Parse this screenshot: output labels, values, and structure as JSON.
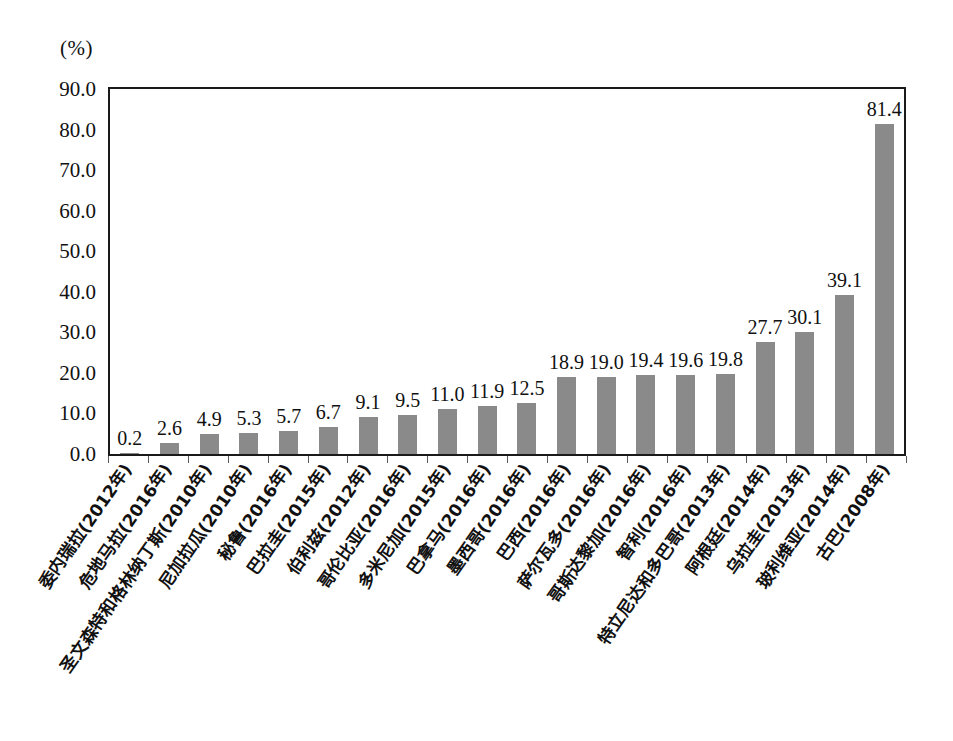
{
  "chart_data": {
    "type": "bar",
    "title": "",
    "subtitle": "",
    "xlabel": "",
    "ylabel": "(%)",
    "unit_label": "(%)",
    "ylim": [
      0.0,
      90.0
    ],
    "ytick_step": 10.0,
    "ytick_labels": [
      "0.0",
      "10.0",
      "20.0",
      "30.0",
      "40.0",
      "50.0",
      "60.0",
      "70.0",
      "80.0",
      "90.0"
    ],
    "ytick_values": [
      0.0,
      10.0,
      20.0,
      30.0,
      40.0,
      50.0,
      60.0,
      70.0,
      80.0,
      90.0
    ],
    "grid": false,
    "legend": false,
    "legend_position": "none",
    "bar_color": "#8a8a8a",
    "frame_color": "#1a1a1a",
    "background_color": "#ffffff",
    "categories": [
      "委内瑞拉(2012年)",
      "危地马拉(2016年)",
      "圣文森特和格林纳丁斯(2010年)",
      "尼加拉瓜(2010年)",
      "秘鲁(2016年)",
      "巴拉圭(2015年)",
      "伯利兹(2012年)",
      "哥伦比亚(2016年)",
      "多米尼加(2015年)",
      "巴拿马(2016年)",
      "墨西哥(2016年)",
      "巴西(2016年)",
      "萨尔瓦多(2016年)",
      "哥斯达黎加(2016年)",
      "智利(2016年)",
      "特立尼达和多巴哥(2013年)",
      "阿根廷(2014年)",
      "乌拉圭(2013年)",
      "玻利维亚(2014年)",
      "古巴(2008年)"
    ],
    "values": [
      0.2,
      2.6,
      4.9,
      5.3,
      5.7,
      6.7,
      9.1,
      9.5,
      11.0,
      11.9,
      12.5,
      18.9,
      19.0,
      19.4,
      19.6,
      19.8,
      27.7,
      30.1,
      39.1,
      81.4
    ],
    "value_labels": [
      "0.2",
      "2.6",
      "4.9",
      "5.3",
      "5.7",
      "6.7",
      "9.1",
      "9.5",
      "11.0",
      "11.9",
      "12.5",
      "18.9",
      "19.0",
      "19.4",
      "19.6",
      "19.8",
      "27.7",
      "30.1",
      "39.1",
      "81.4"
    ]
  }
}
